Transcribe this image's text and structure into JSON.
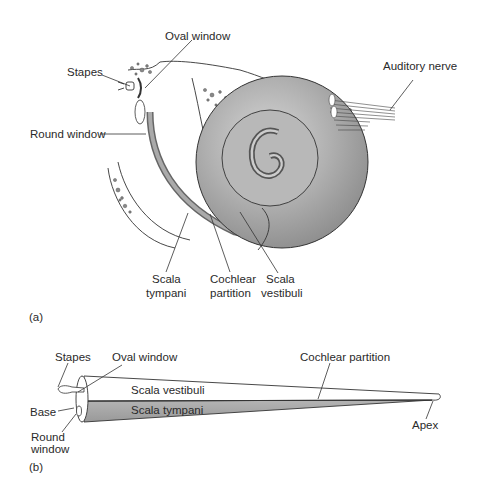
{
  "figure_a": {
    "panel_label": "(a)",
    "labels": {
      "oval_window": "Oval window",
      "stapes": "Stapes",
      "auditory_nerve": "Auditory nerve",
      "round_window": "Round window",
      "scala_tympani_1": "Scala",
      "scala_tympani_2": "tympani",
      "cochlear_partition_1": "Cochlear",
      "cochlear_partition_2": "partition",
      "scala_vestibuli_1": "Scala",
      "scala_vestibuli_2": "vestibuli"
    }
  },
  "figure_b": {
    "panel_label": "(b)",
    "labels": {
      "stapes": "Stapes",
      "oval_window": "Oval window",
      "cochlear_partition": "Cochlear partition",
      "scala_vestibuli": "Scala vestibuli",
      "scala_tympani": "Scala tympani",
      "base": "Base",
      "round_window_1": "Round",
      "round_window_2": "window",
      "apex": "Apex"
    }
  },
  "colors": {
    "cochlea_fill": "#a9a9a9",
    "tube_lower_fill": "#a3a3a3",
    "line": "#333333"
  }
}
